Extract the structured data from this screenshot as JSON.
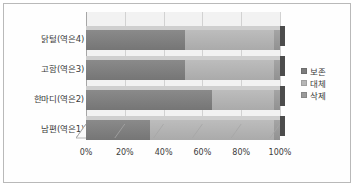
{
  "chart_data": {
    "type": "bar",
    "orientation": "horizontal",
    "stacked": true,
    "percent_stacked": true,
    "title": "",
    "subtitle": "",
    "xlabel": "",
    "ylabel": "",
    "grid": true,
    "legend_position": "right",
    "xlim": [
      0,
      100
    ],
    "xticks": [
      0,
      20,
      40,
      60,
      80,
      100
    ],
    "xtick_labels": [
      "0%",
      "20%",
      "40%",
      "60%",
      "80%",
      "100%"
    ],
    "categories": [
      "남편(역은1)",
      "한마디(역은2)",
      "고함(역은3)",
      "닭털(역은4)"
    ],
    "categories_top_to_bottom": [
      "닭털(역은4)",
      "고함(역은3)",
      "한마디(역은2)",
      "남편(역은1)"
    ],
    "series": [
      {
        "name": "보존",
        "color": "#7d7d7d",
        "values": [
          33,
          65,
          51,
          51
        ]
      },
      {
        "name": "대체",
        "color": "#b5b5b5",
        "values": [
          64,
          32,
          46,
          46
        ]
      },
      {
        "name": "삭제",
        "color": "#9a9a9a",
        "values": [
          3,
          3,
          3,
          3
        ]
      }
    ]
  },
  "legend": {
    "items": [
      {
        "label": "보존",
        "color": "#7d7d7d",
        "marker": "square-swatch-icon"
      },
      {
        "label": "대체",
        "color": "#b5b5b5",
        "marker": "square-swatch-icon"
      },
      {
        "label": "삭제",
        "color": "#9a9a9a",
        "marker": "square-swatch-icon"
      }
    ]
  },
  "axis": {
    "x_tick_labels": [
      "0%",
      "20%",
      "40%",
      "60%",
      "80%",
      "100%"
    ],
    "category_labels_top_to_bottom": [
      "닭털(역은4)",
      "고함(역은3)",
      "한마디(역은2)",
      "남편(역은1)"
    ]
  },
  "colors": {
    "plot_background": "#f2f2f2",
    "frame_border": "#b9b9b9",
    "gridline": "#d2d2d2",
    "axis_line": "#a6a6a6",
    "bar_side_face": "#4c4c4c",
    "bar_top_face": "#cfcfcf",
    "text": "#3b3b3b"
  }
}
